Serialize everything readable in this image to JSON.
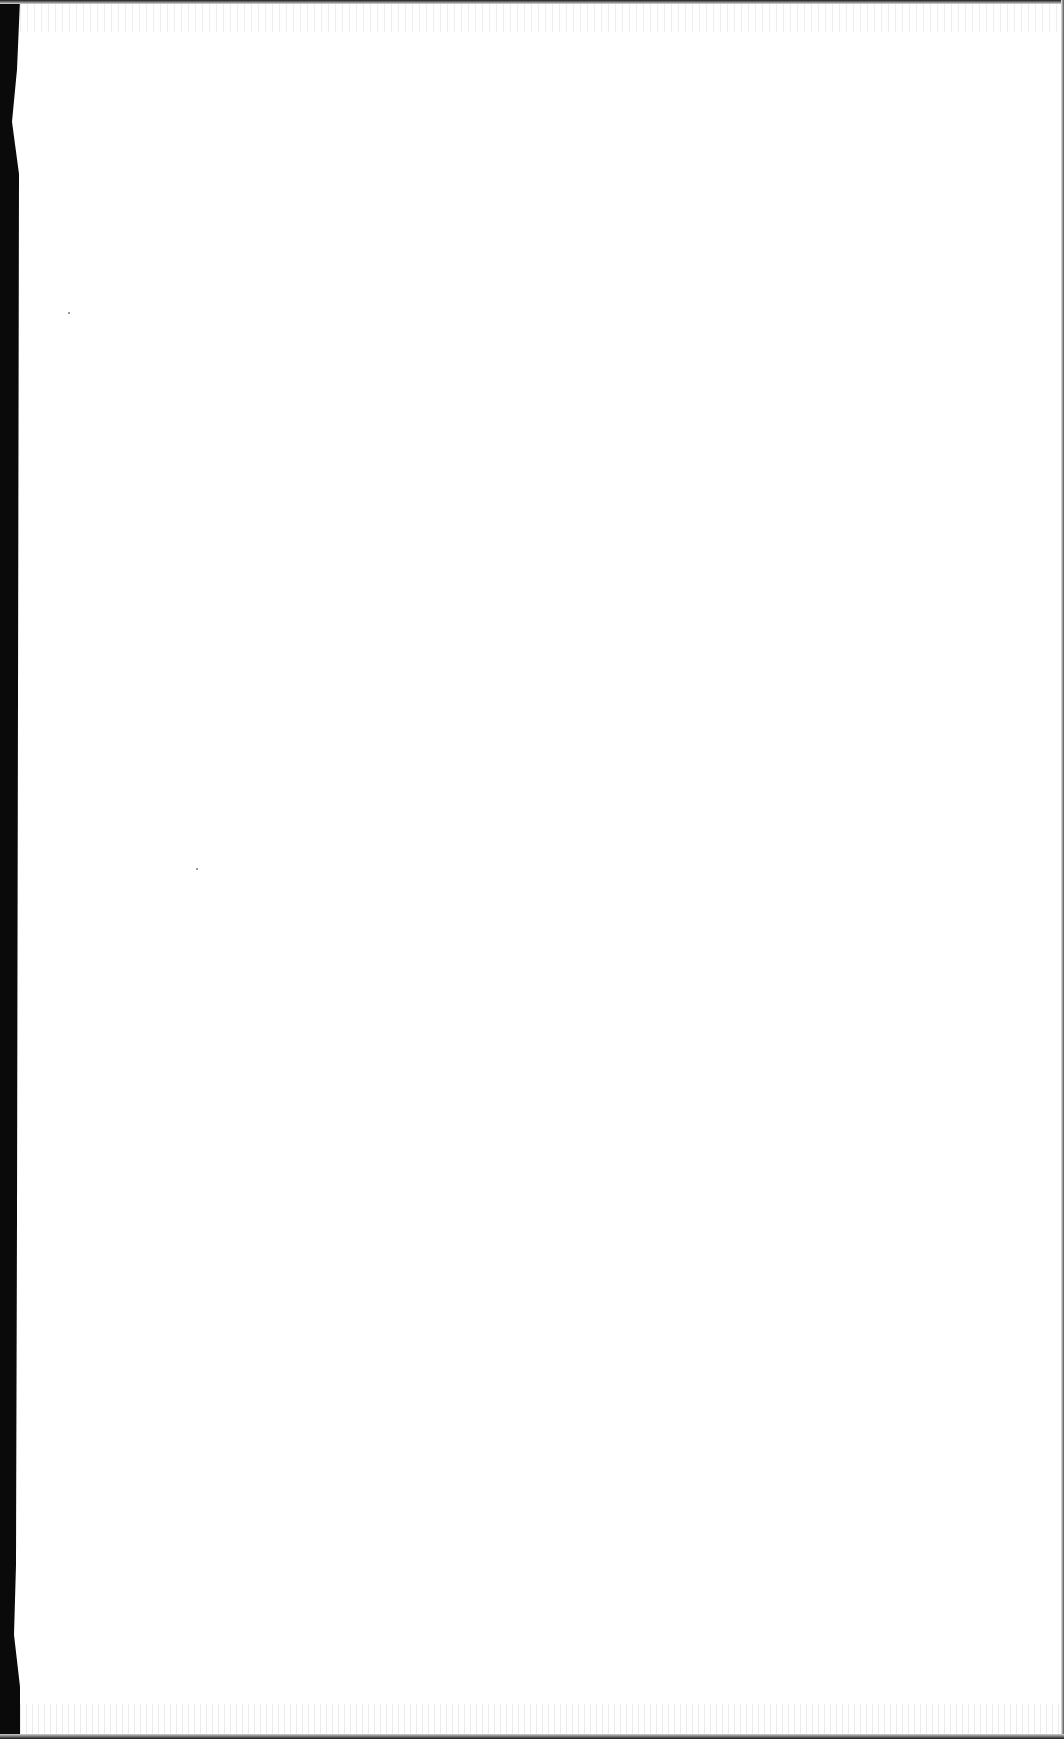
{
  "page": {
    "type": "blank-scanned-page",
    "background_color": "#ffffff",
    "edge_color": "#0a0a0a",
    "text_content": "",
    "specks": [
      {
        "x": 68,
        "y": 312
      },
      {
        "x": 196,
        "y": 868
      }
    ]
  }
}
